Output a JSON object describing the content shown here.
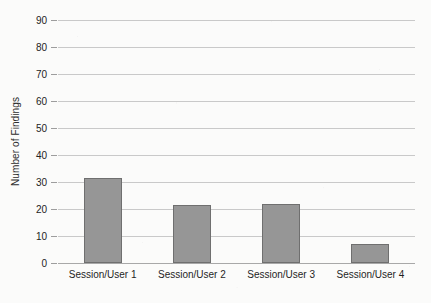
{
  "chart_data": {
    "type": "bar",
    "title": "",
    "xlabel": "",
    "ylabel": "Number of Findings",
    "categories": [
      "Session/User 1",
      "Session/User 2",
      "Session/User 3",
      "Session/User 4"
    ],
    "values": [
      31.5,
      21.5,
      21.8,
      7
    ],
    "series": [
      {
        "name": "Number of Findings",
        "values": [
          31.5,
          21.5,
          21.8,
          7
        ]
      }
    ],
    "ylim": [
      0,
      90
    ],
    "y_tick_step": 10,
    "y_tick_labels": [
      "90",
      "80",
      "70",
      "60",
      "50",
      "40",
      "30",
      "20",
      "10",
      "0"
    ],
    "y_tick_values": [
      90,
      80,
      70,
      60,
      50,
      40,
      30,
      20,
      10,
      0
    ],
    "grid": true,
    "grid_axis": "y",
    "legend": false,
    "legend_position": "none",
    "bar_color": "#969696",
    "bar_edge_color": "#6f6f6f",
    "gridline_color": "#c9c9c9",
    "axis_color": "#a8a8a8",
    "background_color": "#fbfbfa",
    "text_color": "#232323"
  }
}
